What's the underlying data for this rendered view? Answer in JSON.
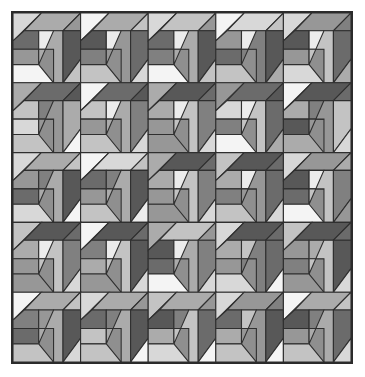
{
  "artwork": {
    "title": "Isometric Cube Tessellation",
    "type": "geometric-tiling",
    "canvas": {
      "width": 365,
      "height": 377,
      "background": "#ffffff"
    },
    "frame": {
      "x": 11,
      "y": 11,
      "width": 342,
      "height": 353,
      "border_color": "#2b2b2b",
      "border_width": 2,
      "fill": "#8f8f8f"
    },
    "grid": {
      "columns": 5,
      "rows": 5,
      "tile_width": 67.6,
      "tile_height": 69.8
    },
    "stroke": {
      "color": "#2f2f2f",
      "width": 1.1
    },
    "palette": {
      "highlight": "#ececec",
      "very_light": "#d8d8d8",
      "light": "#c3c3c3",
      "mid_light": "#ababab",
      "mid": "#979797",
      "mid_dark": "#808080",
      "dark": "#6b6b6b",
      "very_dark": "#585858",
      "white": "#f4f4f4"
    },
    "motif": {
      "name": "cube-with-inner-square",
      "description": "Each unit cell shows an isometric box: a top parallelogram band, a right face split by a diagonal, a left face split by a diagonal, and a small bright square at the inner corner.",
      "parts": [
        "top-left-triangle",
        "top-band",
        "upper-right-wedge",
        "left-face-upper",
        "left-face-lower",
        "inner-square",
        "right-face",
        "lower-right-triangle",
        "bottom-left-wedge"
      ]
    },
    "tiles": [
      [
        {
          "a": "very_light",
          "b": "mid_light",
          "c": "mid",
          "d": "dark",
          "e": "mid",
          "f": "highlight",
          "g": "mid_light",
          "h": "very_dark",
          "i": "light",
          "j": "white"
        },
        {
          "a": "white",
          "b": "mid_light",
          "c": "light",
          "d": "very_dark",
          "e": "mid_dark",
          "f": "highlight",
          "g": "mid",
          "h": "dark",
          "i": "very_light",
          "j": "light"
        },
        {
          "a": "very_light",
          "b": "light",
          "c": "mid",
          "d": "dark",
          "e": "mid_dark",
          "f": "highlight",
          "g": "mid_light",
          "h": "very_dark",
          "i": "light",
          "j": "white"
        },
        {
          "a": "white",
          "b": "very_light",
          "c": "light",
          "d": "mid",
          "e": "dark",
          "f": "highlight",
          "g": "mid_dark",
          "h": "very_dark",
          "i": "mid_light",
          "j": "light"
        },
        {
          "a": "very_light",
          "b": "mid",
          "c": "mid_dark",
          "d": "very_dark",
          "e": "mid",
          "f": "highlight",
          "g": "light",
          "h": "dark",
          "i": "mid_light",
          "j": "very_light"
        }
      ],
      [
        {
          "a": "mid_light",
          "b": "dark",
          "c": "very_dark",
          "d": "light",
          "e": "very_light",
          "f": "mid_dark",
          "g": "mid",
          "h": "mid_light",
          "i": "white",
          "j": "light"
        },
        {
          "a": "white",
          "b": "dark",
          "c": "very_dark",
          "d": "light",
          "e": "mid",
          "f": "highlight",
          "g": "mid_light",
          "h": "mid_dark",
          "i": "very_light",
          "j": "light"
        },
        {
          "a": "mid_light",
          "b": "very_dark",
          "c": "dark",
          "d": "mid_light",
          "e": "mid",
          "f": "highlight",
          "g": "light",
          "h": "mid_dark",
          "i": "very_light",
          "j": "mid"
        },
        {
          "a": "mid",
          "b": "dark",
          "c": "very_dark",
          "d": "very_light",
          "e": "mid_dark",
          "f": "highlight",
          "g": "light",
          "h": "dark",
          "i": "mid_light",
          "j": "white"
        },
        {
          "a": "white",
          "b": "very_dark",
          "c": "dark",
          "d": "mid_light",
          "e": "very_dark",
          "f": "mid_dark",
          "g": "mid",
          "h": "light",
          "i": "very_light",
          "j": "mid_light"
        }
      ],
      [
        {
          "a": "very_light",
          "b": "mid_light",
          "c": "light",
          "d": "mid",
          "e": "dark",
          "f": "mid_dark",
          "g": "mid_light",
          "h": "very_dark",
          "i": "white",
          "j": "very_light"
        },
        {
          "a": "white",
          "b": "very_light",
          "c": "light",
          "d": "dark",
          "e": "mid",
          "f": "mid_dark",
          "g": "mid_light",
          "h": "very_dark",
          "i": "highlight",
          "j": "light"
        },
        {
          "a": "mid_light",
          "b": "very_dark",
          "c": "dark",
          "d": "mid_light",
          "e": "mid",
          "f": "highlight",
          "g": "light",
          "h": "mid_dark",
          "i": "very_light",
          "j": "mid"
        },
        {
          "a": "light",
          "b": "very_dark",
          "c": "dark",
          "d": "mid_light",
          "e": "mid_dark",
          "f": "highlight",
          "g": "mid",
          "h": "dark",
          "i": "very_light",
          "j": "light"
        },
        {
          "a": "very_light",
          "b": "mid",
          "c": "mid_light",
          "d": "very_dark",
          "e": "dark",
          "f": "highlight",
          "g": "light",
          "h": "mid_dark",
          "i": "mid",
          "j": "white"
        }
      ],
      [
        {
          "a": "light",
          "b": "very_dark",
          "c": "dark",
          "d": "mid_light",
          "e": "mid",
          "f": "highlight",
          "g": "light",
          "h": "mid_dark",
          "i": "very_light",
          "j": "mid"
        },
        {
          "a": "white",
          "b": "very_dark",
          "c": "dark",
          "d": "mid_dark",
          "e": "mid_light",
          "f": "highlight",
          "g": "light",
          "h": "very_dark",
          "i": "very_light",
          "j": "mid"
        },
        {
          "a": "mid_light",
          "b": "light",
          "c": "mid",
          "d": "very_dark",
          "e": "dark",
          "f": "highlight",
          "g": "mid_light",
          "h": "mid_dark",
          "i": "very_light",
          "j": "white"
        },
        {
          "a": "very_light",
          "b": "very_dark",
          "c": "dark",
          "d": "mid_light",
          "e": "mid",
          "f": "light",
          "g": "mid_dark",
          "h": "dark",
          "i": "white",
          "j": "very_light"
        },
        {
          "a": "light",
          "b": "very_dark",
          "c": "dark",
          "d": "mid",
          "e": "mid_dark",
          "f": "mid_light",
          "g": "light",
          "h": "very_dark",
          "i": "very_light",
          "j": "mid"
        }
      ],
      [
        {
          "a": "white",
          "b": "mid_light",
          "c": "light",
          "d": "mid_dark",
          "e": "dark",
          "f": "mid",
          "g": "mid_light",
          "h": "very_dark",
          "i": "very_light",
          "j": "light"
        },
        {
          "a": "very_light",
          "b": "mid_light",
          "c": "mid",
          "d": "dark",
          "e": "light",
          "f": "mid_dark",
          "g": "mid_light",
          "h": "very_dark",
          "i": "white",
          "j": "light"
        },
        {
          "a": "light",
          "b": "mid_light",
          "c": "mid",
          "d": "very_dark",
          "e": "mid_light",
          "f": "mid_dark",
          "g": "light",
          "h": "dark",
          "i": "white",
          "j": "very_light"
        },
        {
          "a": "very_light",
          "b": "mid",
          "c": "mid_dark",
          "d": "dark",
          "e": "mid_light",
          "f": "light",
          "g": "mid",
          "h": "very_dark",
          "i": "white",
          "j": "light"
        },
        {
          "a": "white",
          "b": "mid_light",
          "c": "light",
          "d": "very_dark",
          "e": "mid",
          "f": "mid_dark",
          "g": "mid_light",
          "h": "dark",
          "i": "very_light",
          "j": "light"
        }
      ]
    ]
  }
}
